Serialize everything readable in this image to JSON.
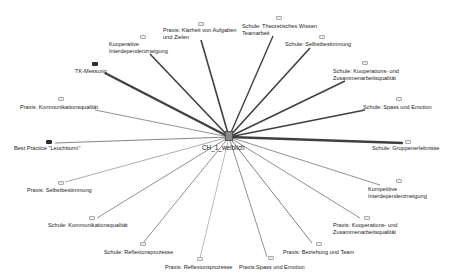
{
  "diagram": {
    "type": "code-relations-network",
    "center": {
      "label": "CH_1_weiblich",
      "x": 229,
      "y": 137
    },
    "nodes": [
      {
        "id": "n1",
        "label": "Praxis: Klarheit von Aufgaben\nund Zielen",
        "icon": [
          198,
          22
        ],
        "text": [
          163,
          27
        ],
        "end": [
          201,
          40
        ],
        "weight": 1.6,
        "shade": "light"
      },
      {
        "id": "n2",
        "label": "Kooperative\nInterdependenzneigung",
        "icon": [
          140,
          35
        ],
        "text": [
          109,
          41
        ],
        "end": [
          150,
          54
        ],
        "weight": 1.6,
        "shade": "light"
      },
      {
        "id": "n3",
        "label": "TK-Messung",
        "icon": [
          92,
          62
        ],
        "text": [
          75,
          68
        ],
        "end": [
          105,
          73
        ],
        "weight": 2.2,
        "shade": "dark"
      },
      {
        "id": "n4",
        "label": "Praxis: Kommunikationsqualität",
        "icon": [
          58,
          97
        ],
        "text": [
          20,
          104
        ],
        "end": [
          95,
          110
        ],
        "weight": 0.8,
        "shade": "light"
      },
      {
        "id": "n5",
        "label": "Best Practice \"Leuchtturm\"",
        "icon": [
          46,
          140
        ],
        "text": [
          14,
          145
        ],
        "end": [
          55,
          143
        ],
        "weight": 0.9,
        "shade": "dark"
      },
      {
        "id": "n6",
        "label": "Schule: Theoretisches Wissen\nTeamarbeit",
        "icon": [
          276,
          16
        ],
        "text": [
          242,
          23
        ],
        "end": [
          273,
          36
        ],
        "weight": 1.4,
        "shade": "light"
      },
      {
        "id": "n7",
        "label": "Schule: Selbstbestimmung",
        "icon": [
          319,
          35
        ],
        "text": [
          285,
          41
        ],
        "end": [
          310,
          48
        ],
        "weight": 1.6,
        "shade": "light"
      },
      {
        "id": "n8",
        "label": "Schule: Kooperations- und\nZusammenarbeitsqualität",
        "icon": [
          362,
          61
        ],
        "text": [
          333,
          68
        ],
        "end": [
          345,
          81
        ],
        "weight": 1.6,
        "shade": "light"
      },
      {
        "id": "n9",
        "label": "Schule: Spass und Emotion",
        "icon": [
          396,
          97
        ],
        "text": [
          363,
          104
        ],
        "end": [
          365,
          110
        ],
        "weight": 1.6,
        "shade": "light"
      },
      {
        "id": "n10",
        "label": "Schule: Gruppenerlebnisse",
        "icon": [
          405,
          140
        ],
        "text": [
          372,
          145
        ],
        "end": [
          403,
          143
        ],
        "weight": 2.4,
        "shade": "light"
      },
      {
        "id": "n11",
        "label": "Kompetitive\nInterdependenzneigung",
        "icon": [
          396,
          179
        ],
        "text": [
          368,
          186
        ],
        "end": [
          380,
          185
        ],
        "weight": 0.8,
        "shade": "light"
      },
      {
        "id": "n12",
        "label": "Praxis: Kooperations- und\nZusammenarbeitsqualität",
        "icon": [
          364,
          216
        ],
        "text": [
          333,
          222
        ],
        "end": [
          360,
          218
        ],
        "weight": 0.8,
        "shade": "light"
      },
      {
        "id": "n13",
        "label": "Praxis: Beziehung und Team",
        "icon": [
          316,
          242
        ],
        "text": [
          283,
          249
        ],
        "end": [
          312,
          243
        ],
        "weight": 0.9,
        "shade": "light"
      },
      {
        "id": "n14",
        "label": "Praxis:Spass und Emotion",
        "icon": [
          268,
          256
        ],
        "text": [
          239,
          264
        ],
        "end": [
          267,
          257
        ],
        "weight": 0.8,
        "shade": "light"
      },
      {
        "id": "n15",
        "label": "Praxis: Reflexionsprozesse",
        "icon": [
          197,
          257
        ],
        "text": [
          165,
          264
        ],
        "end": [
          200,
          258
        ],
        "weight": 0.5,
        "shade": "light"
      },
      {
        "id": "n16",
        "label": "Schule: Reflexionsprozesse",
        "icon": [
          140,
          242
        ],
        "text": [
          104,
          249
        ],
        "end": [
          143,
          243
        ],
        "weight": 0.8,
        "shade": "light"
      },
      {
        "id": "n17",
        "label": "Schule: Kommunikationsqualität",
        "icon": [
          89,
          216
        ],
        "text": [
          48,
          222
        ],
        "end": [
          97,
          218
        ],
        "weight": 0.8,
        "shade": "light"
      },
      {
        "id": "n18",
        "label": "Praxis: Selbstbestimmung",
        "icon": [
          58,
          181
        ],
        "text": [
          27,
          187
        ],
        "end": [
          65,
          182
        ],
        "weight": 0.6,
        "shade": "light"
      }
    ],
    "colors": {
      "edge": "#2b2b2b",
      "background": "#ffffff",
      "text": "#222222"
    }
  }
}
